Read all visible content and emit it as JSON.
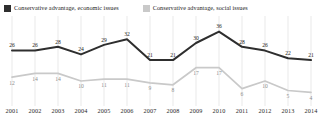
{
  "legend": {
    "items": [
      {
        "label": "Conservative advantage, economic issues",
        "color": "#2e2e2e",
        "key": "economic"
      },
      {
        "label": "Conservative advantage, social issues",
        "color": "#c9c9c9",
        "key": "social"
      }
    ]
  },
  "chart_data": {
    "type": "line",
    "title": "",
    "xlabel": "",
    "ylabel": "",
    "grid": "vertical",
    "legend_position": "top-left",
    "ylim": [
      0,
      40
    ],
    "categories": [
      "2001",
      "2002",
      "2003",
      "2004",
      "2005",
      "2006",
      "2007",
      "2008",
      "2009",
      "2010",
      "2011",
      "2012",
      "2013",
      "2014"
    ],
    "series": [
      {
        "name": "Conservative advantage, economic issues",
        "color": "#2e2e2e",
        "values": [
          26,
          26,
          28,
          24,
          29,
          32,
          21,
          21,
          30,
          36,
          28,
          26,
          22,
          21
        ]
      },
      {
        "name": "Conservative advantage, social issues",
        "color": "#c9c9c9",
        "values": [
          12,
          14,
          14,
          10,
          11,
          11,
          9,
          8,
          17,
          17,
          6,
          10,
          5,
          4
        ]
      }
    ]
  }
}
